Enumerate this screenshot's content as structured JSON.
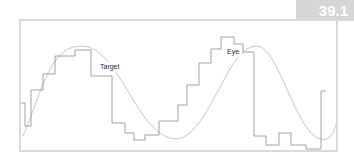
{
  "figure": {
    "number": "39.1",
    "band_color": "#d6d6d6",
    "number_color": "#ffffff"
  },
  "frame": {
    "border_color": "#dadada",
    "background": "#ffffff"
  },
  "labels": {
    "target": "Target",
    "eye": "Eye"
  },
  "chart_data": {
    "type": "line",
    "title": "",
    "xlabel": "",
    "ylabel": "",
    "grid": false,
    "legend": "inline-annotations",
    "xlim": [
      0,
      319
    ],
    "ylim": [
      0,
      133
    ],
    "axes_visible": false,
    "series": [
      {
        "name": "Target",
        "style": "smooth-sinusoid",
        "color": "#b9b9b9",
        "width": 0.8,
        "annotation": "Target",
        "points": [
          [
            2,
            115
          ],
          [
            8,
            100
          ],
          [
            14,
            84
          ],
          [
            20,
            68
          ],
          [
            26,
            54
          ],
          [
            32,
            43
          ],
          [
            38,
            35
          ],
          [
            45,
            29
          ],
          [
            52,
            26
          ],
          [
            60,
            25
          ],
          [
            68,
            26
          ],
          [
            76,
            30
          ],
          [
            84,
            37
          ],
          [
            92,
            47
          ],
          [
            100,
            59
          ],
          [
            108,
            72
          ],
          [
            116,
            85
          ],
          [
            124,
            97
          ],
          [
            132,
            106
          ],
          [
            140,
            113
          ],
          [
            148,
            117
          ],
          [
            156,
            118
          ],
          [
            163,
            116
          ],
          [
            170,
            111
          ],
          [
            177,
            103
          ],
          [
            184,
            93
          ],
          [
            191,
            81
          ],
          [
            198,
            68
          ],
          [
            205,
            55
          ],
          [
            212,
            43
          ],
          [
            219,
            34
          ],
          [
            226,
            28
          ],
          [
            233,
            25
          ],
          [
            240,
            26
          ],
          [
            247,
            32
          ],
          [
            254,
            43
          ],
          [
            261,
            57
          ],
          [
            268,
            73
          ],
          [
            275,
            88
          ],
          [
            282,
            101
          ],
          [
            289,
            111
          ],
          [
            296,
            117
          ],
          [
            303,
            119
          ],
          [
            308,
            117
          ],
          [
            312,
            112
          ],
          [
            315,
            104
          ],
          [
            317,
            95
          ],
          [
            318,
            88
          ]
        ]
      },
      {
        "name": "Eye",
        "style": "staircase",
        "color": "#8c8c8c",
        "width": 0.8,
        "annotation": "Eye",
        "steps": [
          [
            0,
            82
          ],
          [
            4,
            82
          ],
          [
            4,
            105
          ],
          [
            10,
            105
          ],
          [
            10,
            69
          ],
          [
            22,
            69
          ],
          [
            22,
            53
          ],
          [
            34,
            53
          ],
          [
            34,
            35
          ],
          [
            54,
            35
          ],
          [
            54,
            29
          ],
          [
            70,
            29
          ],
          [
            70,
            55
          ],
          [
            91,
            55
          ],
          [
            91,
            102
          ],
          [
            104,
            102
          ],
          [
            104,
            112
          ],
          [
            113,
            112
          ],
          [
            113,
            119
          ],
          [
            124,
            119
          ],
          [
            124,
            114
          ],
          [
            138,
            114
          ],
          [
            138,
            100
          ],
          [
            157,
            100
          ],
          [
            157,
            84
          ],
          [
            166,
            84
          ],
          [
            166,
            64
          ],
          [
            178,
            64
          ],
          [
            178,
            42
          ],
          [
            190,
            42
          ],
          [
            190,
            28
          ],
          [
            200,
            28
          ],
          [
            200,
            16
          ],
          [
            213,
            16
          ],
          [
            213,
            23
          ],
          [
            222,
            23
          ],
          [
            222,
            31
          ],
          [
            233,
            31
          ],
          [
            233,
            115
          ],
          [
            245,
            115
          ],
          [
            245,
            124
          ],
          [
            258,
            124
          ],
          [
            258,
            112
          ],
          [
            270,
            112
          ],
          [
            270,
            124
          ],
          [
            285,
            124
          ],
          [
            285,
            128
          ],
          [
            300,
            128
          ],
          [
            300,
            70
          ],
          [
            305,
            70
          ]
        ]
      }
    ],
    "annotations": [
      {
        "text": "Target",
        "x": 77,
        "y": 41
      },
      {
        "text": "Eye",
        "x": 204,
        "y": 26
      }
    ]
  }
}
